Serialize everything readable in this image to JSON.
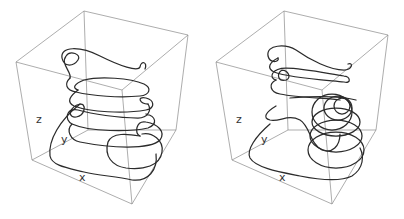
{
  "figure": {
    "panels": [
      {
        "id": "left",
        "axis_labels": {
          "x": "x",
          "y": "y",
          "z": "z"
        },
        "description": "3D space curve winding in stacked loops inside a bounding box"
      },
      {
        "id": "right",
        "axis_labels": {
          "x": "x",
          "y": "y",
          "z": "z"
        },
        "description": "3D space curve with stacked loops and nested circular loops on right side"
      }
    ],
    "colors": {
      "box": "#8a8a8a",
      "curve": "#2b2b2b",
      "label": "#333333",
      "background": "#ffffff"
    }
  }
}
